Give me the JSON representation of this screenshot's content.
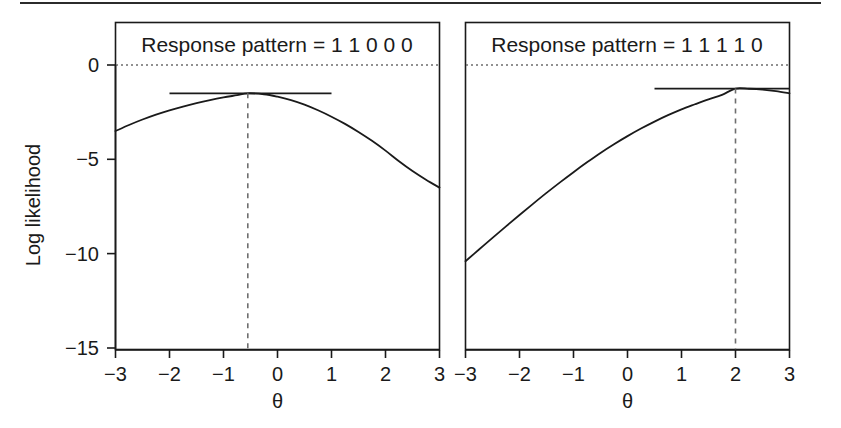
{
  "figure": {
    "width": 841,
    "height": 428,
    "background": "#ffffff",
    "ink_color": "#1a1a1a",
    "guide_color": "#6e6e6e",
    "top_rule": true
  },
  "axis": {
    "ylabel": "Log likelihood",
    "xlabel": "θ",
    "x_ticks": [
      "−3",
      "−2",
      "−1",
      "0",
      "1",
      "2",
      "3"
    ],
    "x_tick_values": [
      -3,
      -2,
      -1,
      0,
      1,
      2,
      3
    ],
    "y_ticks": [
      "0",
      "−5",
      "−10",
      "−15"
    ],
    "y_tick_values": [
      0,
      -5,
      -10,
      -15
    ],
    "xlim": [
      -3,
      3
    ],
    "ylim": [
      -15,
      0.8
    ],
    "grid": false,
    "zero_reference_line": true
  },
  "panels": [
    {
      "id": "panel-left",
      "title": "Response pattern = 1 1 0 0 0",
      "mle_theta": -0.55,
      "mle_loglik": -1.5
    },
    {
      "id": "panel-right",
      "title": "Response pattern = 1 1 1 1 0",
      "mle_theta": 2.0,
      "mle_loglik": -1.25
    }
  ],
  "chart_data": {
    "type": "line",
    "title": "",
    "xlabel": "θ",
    "ylabel": "Log likelihood",
    "xlim": [
      -3,
      3
    ],
    "ylim": [
      -15,
      0
    ],
    "grid": false,
    "legend": "none",
    "panel_layout": "1x2",
    "panels": [
      {
        "name": "Response pattern = 1 1 0 0 0",
        "annotations": {
          "mle_theta": -0.55,
          "mle_loglik": -1.5,
          "vertical_dashed_line_at_theta": -0.55,
          "horizontal_tangent_segment": {
            "from_theta": -2.0,
            "to_theta": 1.0,
            "loglik": -1.5
          },
          "horizontal_dotted_line_at_loglik": 0
        },
        "x": [
          -3,
          -2.75,
          -2.5,
          -2.25,
          -2,
          -1.75,
          -1.5,
          -1.25,
          -1,
          -0.75,
          -0.55,
          -0.25,
          0,
          0.25,
          0.5,
          0.75,
          1,
          1.25,
          1.5,
          1.75,
          2,
          2.25,
          2.5,
          2.75,
          3
        ],
        "y": [
          -3.5,
          -3.18,
          -2.89,
          -2.63,
          -2.4,
          -2.2,
          -2.02,
          -1.86,
          -1.72,
          -1.6,
          -1.5,
          -1.55,
          -1.68,
          -1.86,
          -2.1,
          -2.4,
          -2.74,
          -3.12,
          -3.55,
          -4.02,
          -4.54,
          -5.1,
          -5.62,
          -6.08,
          -6.5
        ]
      },
      {
        "name": "Response pattern = 1 1 1 1 0",
        "annotations": {
          "mle_theta": 2.0,
          "mle_loglik": -1.25,
          "vertical_dashed_line_at_theta": 2.0,
          "horizontal_tangent_segment": {
            "from_theta": 0.5,
            "to_theta": 3.0,
            "loglik": -1.25
          },
          "horizontal_dotted_line_at_loglik": 0
        },
        "x": [
          -3,
          -2.75,
          -2.5,
          -2.25,
          -2,
          -1.75,
          -1.5,
          -1.25,
          -1,
          -0.75,
          -0.5,
          -0.25,
          0,
          0.25,
          0.5,
          0.75,
          1,
          1.25,
          1.5,
          1.75,
          2,
          2.25,
          2.5,
          2.75,
          3
        ],
        "y": [
          -10.4,
          -9.78,
          -9.16,
          -8.55,
          -7.95,
          -7.36,
          -6.78,
          -6.22,
          -5.68,
          -5.16,
          -4.66,
          -4.2,
          -3.77,
          -3.37,
          -3.0,
          -2.66,
          -2.35,
          -2.08,
          -1.82,
          -1.58,
          -1.25,
          -1.26,
          -1.3,
          -1.38,
          -1.5
        ]
      }
    ]
  }
}
